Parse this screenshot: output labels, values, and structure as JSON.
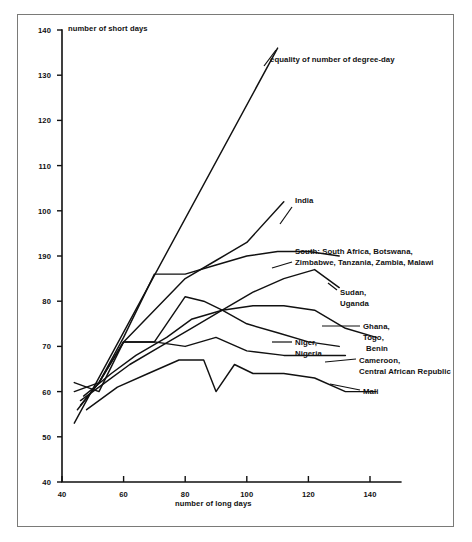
{
  "figure": {
    "y_axis_title": "number of short days",
    "x_axis_title": "number of long days",
    "y_ticks": [
      "140",
      "130",
      "120",
      "110",
      "100",
      "190",
      "80",
      "70",
      "60",
      "50",
      "40"
    ],
    "x_ticks": [
      "40",
      "60",
      "80",
      "100",
      "120",
      "140"
    ]
  },
  "labels": {
    "equality": "equality of number of degree-day",
    "india": "India",
    "south_line1": "South: South Africa, Botswana,",
    "south_line2": "Zimbabwe, Tanzania, Zambia, Malawi",
    "sudan_line1": "Sudan,",
    "sudan_line2": "Uganda",
    "ghana_line1": "Ghana,",
    "ghana_line2": "Togo,",
    "ghana_line3": "Benin",
    "niger_line1": "Niger,",
    "niger_line2": "Nigeria",
    "cameroon_line1": "Cameroon,",
    "cameroon_line2": "Central African Republic",
    "mali": "Mali"
  },
  "chart_data": {
    "type": "line",
    "title": "",
    "xlabel": "number of long days",
    "ylabel": "number of short days",
    "xlim": [
      40,
      150
    ],
    "ylim": [
      40,
      140
    ],
    "xticks": [
      40,
      60,
      80,
      100,
      120,
      140
    ],
    "yticks": [
      40,
      50,
      60,
      70,
      80,
      90,
      100,
      110,
      120,
      130,
      140
    ],
    "ytick_labels": [
      "40",
      "50",
      "60",
      "70",
      "80",
      "90",
      "100",
      "110",
      "120",
      "130",
      "140"
    ],
    "grid": false,
    "legend": "annotations-at-line-ends",
    "note": "Y tick at 90 is printed as '190' in the original scan.",
    "series": [
      {
        "name": "equality of number of degree-day",
        "kind": "reference-line",
        "points": [
          [
            44,
            53
          ],
          [
            110,
            136
          ]
        ]
      },
      {
        "name": "India",
        "points": [
          [
            46,
            57
          ],
          [
            52,
            62
          ],
          [
            60,
            71
          ],
          [
            70,
            78
          ],
          [
            80,
            85
          ],
          [
            90,
            89
          ],
          [
            100,
            93
          ],
          [
            112,
            102
          ]
        ]
      },
      {
        "name": "South: South Africa, Botswana, Zimbabwe, Tanzania, Zambia, Malawi",
        "points": [
          [
            45,
            56
          ],
          [
            52,
            62
          ],
          [
            60,
            72
          ],
          [
            70,
            86
          ],
          [
            80,
            86
          ],
          [
            90,
            88
          ],
          [
            100,
            90
          ],
          [
            110,
            91
          ],
          [
            120,
            91
          ],
          [
            130,
            90
          ]
        ]
      },
      {
        "name": "Sudan, Uganda",
        "points": [
          [
            46,
            58
          ],
          [
            54,
            62
          ],
          [
            62,
            66
          ],
          [
            72,
            70
          ],
          [
            82,
            74
          ],
          [
            92,
            78
          ],
          [
            102,
            82
          ],
          [
            112,
            85
          ],
          [
            122,
            87
          ],
          [
            130,
            83
          ]
        ]
      },
      {
        "name": "Ghana, Togo, Benin",
        "points": [
          [
            47,
            59
          ],
          [
            56,
            64
          ],
          [
            64,
            68
          ],
          [
            74,
            72
          ],
          [
            82,
            76
          ],
          [
            92,
            78
          ],
          [
            102,
            79
          ],
          [
            112,
            79
          ],
          [
            122,
            78
          ],
          [
            132,
            74
          ],
          [
            142,
            72
          ]
        ]
      },
      {
        "name": "Niger, Nigeria",
        "points": [
          [
            44,
            60
          ],
          [
            52,
            62
          ],
          [
            60,
            71
          ],
          [
            70,
            71
          ],
          [
            80,
            81
          ],
          [
            86,
            80
          ],
          [
            92,
            78
          ],
          [
            100,
            75
          ],
          [
            110,
            73
          ],
          [
            120,
            71
          ],
          [
            130,
            70
          ]
        ]
      },
      {
        "name": "Cameroon, Central African Republic",
        "points": [
          [
            44,
            62
          ],
          [
            52,
            60
          ],
          [
            60,
            71
          ],
          [
            70,
            71
          ],
          [
            80,
            70
          ],
          [
            90,
            72
          ],
          [
            100,
            69
          ],
          [
            112,
            68
          ],
          [
            122,
            68
          ],
          [
            132,
            68
          ]
        ]
      },
      {
        "name": "Mali",
        "points": [
          [
            48,
            56
          ],
          [
            58,
            61
          ],
          [
            68,
            64
          ],
          [
            78,
            67
          ],
          [
            86,
            67
          ],
          [
            90,
            60
          ],
          [
            96,
            66
          ],
          [
            102,
            64
          ],
          [
            112,
            64
          ],
          [
            122,
            63
          ],
          [
            132,
            60
          ],
          [
            142,
            60
          ]
        ]
      }
    ]
  }
}
